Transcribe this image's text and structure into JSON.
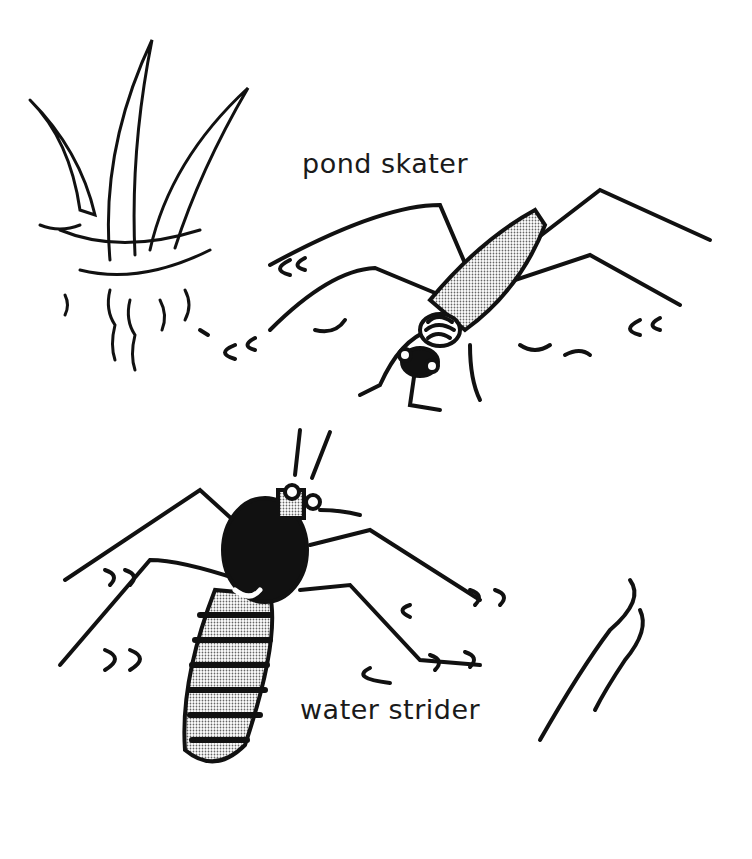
{
  "illustration": {
    "labels": {
      "pond_skater": "pond skater",
      "water_strider": "water strider"
    },
    "colors": {
      "ink": "#111111",
      "paper": "#ffffff",
      "stipple": "#bdbdbd"
    }
  }
}
